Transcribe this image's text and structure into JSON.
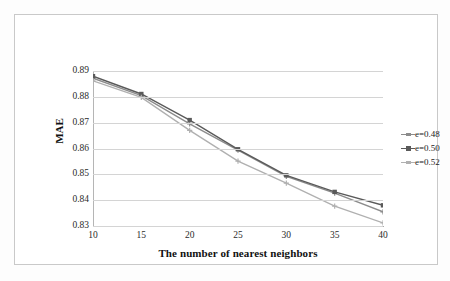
{
  "chart_data": {
    "type": "line",
    "title": "",
    "xlabel": "The number of nearest neighbors",
    "ylabel": "MAE",
    "x": [
      10,
      15,
      20,
      25,
      30,
      35,
      40
    ],
    "xticklabels": [
      "10",
      "15",
      "20",
      "25",
      "30",
      "35",
      "40"
    ],
    "yticklabels": [
      "0.89",
      "0.88",
      "0.87",
      "0.86",
      "0.85",
      "0.84",
      "0.83"
    ],
    "yticks": [
      0.89,
      0.88,
      0.87,
      0.86,
      0.85,
      0.84,
      0.83
    ],
    "xlim": [
      10,
      40
    ],
    "ylim": [
      0.83,
      0.89
    ],
    "grid": "horizontal",
    "legend_position": "right",
    "series": [
      {
        "name": "e=0.48",
        "values": [
          0.8872,
          0.8805,
          0.8695,
          0.8594,
          0.8492,
          0.8427,
          0.8355
        ],
        "color": "#8c8c8c",
        "marker": "plus"
      },
      {
        "name": "e=0.50",
        "values": [
          0.888,
          0.8811,
          0.871,
          0.8597,
          0.8496,
          0.8432,
          0.838
        ],
        "color": "#5a5a5a",
        "marker": "square"
      },
      {
        "name": "e=0.52",
        "values": [
          0.8862,
          0.8798,
          0.867,
          0.8551,
          0.8466,
          0.8377,
          0.8312
        ],
        "color": "#b0b0b0",
        "marker": "plus"
      }
    ]
  },
  "colors": {
    "gridline": "#d4d4d4",
    "axis": "#a8a8a8",
    "frame": "#c9c9c9",
    "text": "#2b2b2b"
  }
}
